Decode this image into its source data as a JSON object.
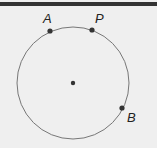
{
  "diagram": {
    "circle": {
      "cx": 73,
      "cy": 83,
      "r": 56,
      "stroke": "#777777"
    },
    "center": {
      "x": 73,
      "y": 83
    },
    "points": [
      {
        "label": "A",
        "x": 50,
        "y": 31
      },
      {
        "label": "P",
        "x": 92,
        "y": 30
      },
      {
        "label": "B",
        "x": 122,
        "y": 108
      }
    ]
  }
}
